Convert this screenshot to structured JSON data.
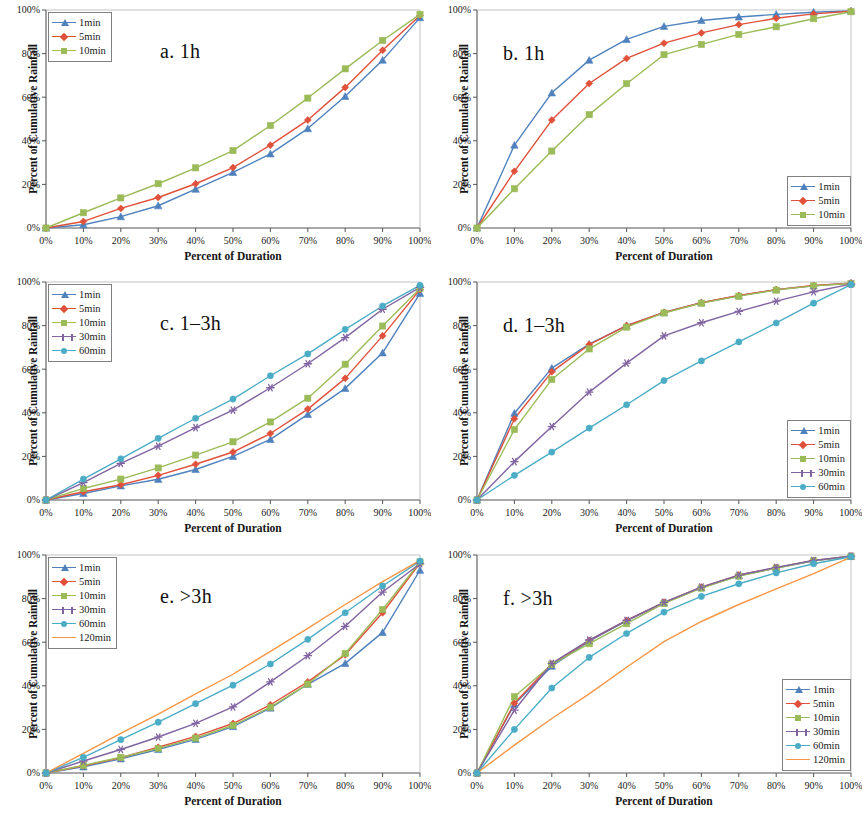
{
  "figure": {
    "axis_x_label": "Percent of Duration",
    "axis_y_label": "Percent of Cumulative Rainfall",
    "x_ticks": [
      "0%",
      "10%",
      "20%",
      "30%",
      "40%",
      "50%",
      "60%",
      "70%",
      "80%",
      "90%",
      "100%"
    ],
    "y_ticks": [
      "0%",
      "20%",
      "40%",
      "60%",
      "80%",
      "100%"
    ]
  },
  "colors": {
    "1min": "#4f81bd",
    "5min": "#e0503a",
    "10min": "#9bbb59",
    "30min": "#8064a2",
    "60min": "#4bacc6",
    "120min": "#f79646"
  },
  "chart_data": [
    {
      "type": "line",
      "panel": "a",
      "title": "a. 1h",
      "title_pos": "center",
      "legend_position": "top-left",
      "xlabel": "Percent of Duration",
      "ylabel": "Percent of Cumulative Rainfall",
      "xlim": [
        0,
        100
      ],
      "ylim": [
        0,
        100
      ],
      "grid": false,
      "x": [
        0,
        10,
        20,
        30,
        40,
        50,
        60,
        70,
        80,
        90,
        100
      ],
      "series": [
        {
          "name": "1min",
          "marker": "triangle",
          "values": [
            0,
            1.5,
            5.2,
            10.2,
            17.8,
            25.5,
            34.0,
            45.6,
            60.4,
            77.0,
            96.5
          ]
        },
        {
          "name": "5min",
          "marker": "diamond",
          "values": [
            0,
            3.0,
            9.0,
            14.0,
            20.3,
            27.7,
            38.0,
            49.5,
            64.5,
            81.5,
            97.5
          ]
        },
        {
          "name": "10min",
          "marker": "square",
          "values": [
            0,
            7.0,
            13.8,
            20.3,
            27.6,
            35.5,
            47.0,
            59.6,
            73.0,
            86.0,
            98.0
          ]
        }
      ]
    },
    {
      "type": "line",
      "panel": "b",
      "title": "b. 1h",
      "title_pos": "left",
      "legend_position": "bottom-right",
      "xlabel": "Percent of Duration",
      "ylabel": "Percent of Cumulative Rainfall",
      "xlim": [
        0,
        100
      ],
      "ylim": [
        0,
        100
      ],
      "grid": false,
      "x": [
        0,
        10,
        20,
        30,
        40,
        50,
        60,
        70,
        80,
        90,
        100
      ],
      "series": [
        {
          "name": "1min",
          "marker": "triangle",
          "values": [
            0,
            38.0,
            62.0,
            77.0,
            86.5,
            92.5,
            95.2,
            96.8,
            98.0,
            99.0,
            99.6
          ]
        },
        {
          "name": "5min",
          "marker": "diamond",
          "values": [
            0,
            26.0,
            49.5,
            66.3,
            77.8,
            84.8,
            89.5,
            93.3,
            96.2,
            98.2,
            99.4
          ]
        },
        {
          "name": "10min",
          "marker": "square",
          "values": [
            0,
            18.0,
            35.3,
            52.0,
            66.2,
            79.5,
            84.2,
            88.8,
            92.3,
            96.0,
            99.2
          ]
        }
      ]
    },
    {
      "type": "line",
      "panel": "c",
      "title": "c. 1–3h",
      "title_pos": "center",
      "legend_position": "top-left",
      "xlabel": "Percent of Duration",
      "ylabel": "Percent of Cumulative Rainfall",
      "xlim": [
        0,
        100
      ],
      "ylim": [
        0,
        100
      ],
      "grid": false,
      "x": [
        0,
        10,
        20,
        30,
        40,
        50,
        60,
        70,
        80,
        90,
        100
      ],
      "series": [
        {
          "name": "1min",
          "marker": "triangle",
          "values": [
            0,
            3.0,
            6.5,
            9.5,
            14.0,
            20.0,
            27.8,
            39.3,
            51.2,
            67.5,
            94.8
          ]
        },
        {
          "name": "5min",
          "marker": "diamond",
          "values": [
            0,
            3.8,
            7.0,
            11.3,
            16.4,
            22.0,
            30.5,
            41.7,
            55.8,
            75.3,
            96.5
          ]
        },
        {
          "name": "10min",
          "marker": "square",
          "values": [
            0,
            5.3,
            9.6,
            14.7,
            20.6,
            26.7,
            35.8,
            46.7,
            62.3,
            79.8,
            97.0
          ]
        },
        {
          "name": "30min",
          "marker": "star",
          "values": [
            0,
            8.0,
            16.8,
            24.7,
            33.2,
            41.2,
            51.5,
            62.5,
            74.5,
            87.5,
            97.5
          ]
        },
        {
          "name": "60min",
          "marker": "circle",
          "values": [
            0,
            9.6,
            18.9,
            28.3,
            37.5,
            46.3,
            57.0,
            67.0,
            78.3,
            89.0,
            98.5
          ]
        }
      ]
    },
    {
      "type": "line",
      "panel": "d",
      "title": "d. 1–3h",
      "title_pos": "left",
      "legend_position": "bottom-right",
      "xlabel": "Percent of Duration",
      "ylabel": "Percent of Cumulative Rainfall",
      "xlim": [
        0,
        100
      ],
      "ylim": [
        0,
        100
      ],
      "grid": false,
      "x": [
        0,
        10,
        20,
        30,
        40,
        50,
        60,
        70,
        80,
        90,
        100
      ],
      "series": [
        {
          "name": "1min",
          "marker": "triangle",
          "values": [
            0,
            39.8,
            60.5,
            71.5,
            80.0,
            86.0,
            90.5,
            93.7,
            96.5,
            98.3,
            99.5
          ]
        },
        {
          "name": "5min",
          "marker": "diamond",
          "values": [
            0,
            37.3,
            58.8,
            71.3,
            80.0,
            86.0,
            90.5,
            93.8,
            96.5,
            98.4,
            99.5
          ]
        },
        {
          "name": "10min",
          "marker": "square",
          "values": [
            0,
            32.3,
            55.3,
            69.3,
            79.3,
            85.8,
            90.3,
            93.5,
            96.3,
            98.2,
            99.3
          ]
        },
        {
          "name": "30min",
          "marker": "star",
          "values": [
            0,
            17.6,
            33.7,
            49.5,
            62.8,
            75.3,
            81.3,
            86.5,
            91.2,
            95.5,
            99.0
          ]
        },
        {
          "name": "60min",
          "marker": "circle",
          "values": [
            0,
            11.3,
            22.0,
            33.0,
            43.7,
            54.8,
            63.8,
            72.5,
            81.2,
            90.3,
            98.8
          ]
        }
      ]
    },
    {
      "type": "line",
      "panel": "e",
      "title": "e. >3h",
      "title_pos": "center",
      "legend_position": "top-left",
      "xlabel": "Percent of Duration",
      "ylabel": "Percent of Cumulative Rainfall",
      "xlim": [
        0,
        100
      ],
      "ylim": [
        0,
        100
      ],
      "grid": false,
      "x": [
        0,
        10,
        20,
        30,
        40,
        50,
        60,
        70,
        80,
        90,
        100
      ],
      "series": [
        {
          "name": "1min",
          "marker": "triangle",
          "values": [
            0,
            2.8,
            6.5,
            10.8,
            15.4,
            21.3,
            29.8,
            40.7,
            50.3,
            64.5,
            93.0
          ]
        },
        {
          "name": "5min",
          "marker": "diamond",
          "values": [
            0,
            3.3,
            7.0,
            11.8,
            16.8,
            22.7,
            31.3,
            41.8,
            54.2,
            73.5,
            96.3
          ]
        },
        {
          "name": "10min",
          "marker": "square",
          "values": [
            0,
            3.5,
            7.2,
            11.3,
            16.0,
            21.8,
            30.2,
            40.8,
            54.8,
            75.0,
            96.8
          ]
        },
        {
          "name": "30min",
          "marker": "star",
          "values": [
            0,
            5.5,
            10.8,
            16.5,
            22.8,
            30.3,
            41.8,
            53.8,
            67.3,
            83.0,
            96.0
          ]
        },
        {
          "name": "60min",
          "marker": "circle",
          "values": [
            0,
            7.2,
            15.3,
            23.3,
            31.8,
            40.3,
            50.0,
            61.3,
            73.5,
            85.8,
            97.2
          ]
        },
        {
          "name": "120min",
          "marker": "none",
          "values": [
            0,
            9.0,
            18.2,
            27.0,
            36.3,
            45.3,
            55.8,
            66.3,
            77.3,
            87.8,
            97.5
          ]
        }
      ]
    },
    {
      "type": "line",
      "panel": "f",
      "title": "f. >3h",
      "title_pos": "left",
      "legend_position": "bottom-right",
      "xlabel": "Percent of Duration",
      "ylabel": "Percent of Cumulative Rainfall",
      "xlim": [
        0,
        100
      ],
      "ylim": [
        0,
        100
      ],
      "grid": false,
      "x": [
        0,
        10,
        20,
        30,
        40,
        50,
        60,
        70,
        80,
        90,
        100
      ],
      "series": [
        {
          "name": "1min",
          "marker": "triangle",
          "values": [
            0,
            31.5,
            49.0,
            60.5,
            69.8,
            78.0,
            85.0,
            90.5,
            94.0,
            97.3,
            99.4
          ]
        },
        {
          "name": "5min",
          "marker": "diamond",
          "values": [
            0,
            32.0,
            50.0,
            60.8,
            70.0,
            78.3,
            85.3,
            90.8,
            94.2,
            97.5,
            99.5
          ]
        },
        {
          "name": "10min",
          "marker": "square",
          "values": [
            0,
            35.0,
            49.8,
            59.3,
            68.5,
            77.8,
            84.8,
            90.3,
            94.0,
            97.3,
            99.4
          ]
        },
        {
          "name": "30min",
          "marker": "star",
          "values": [
            0,
            28.8,
            50.3,
            61.0,
            70.0,
            78.3,
            85.3,
            90.8,
            94.3,
            97.5,
            99.5
          ]
        },
        {
          "name": "60min",
          "marker": "circle",
          "values": [
            0,
            20.0,
            39.0,
            53.0,
            64.0,
            73.8,
            81.0,
            86.8,
            91.8,
            96.0,
            99.2
          ]
        },
        {
          "name": "120min",
          "marker": "none",
          "values": [
            0,
            12.8,
            25.0,
            36.3,
            48.5,
            60.3,
            69.5,
            77.3,
            84.5,
            91.5,
            99.0
          ]
        }
      ]
    }
  ],
  "legends": {
    "a": [
      "1min",
      "5min",
      "10min"
    ],
    "b": [
      "1min",
      "5min",
      "10min"
    ],
    "c": [
      "1min",
      "5min",
      "10min",
      "30min",
      "60min"
    ],
    "d": [
      "1min",
      "5min",
      "10min",
      "30min",
      "60min"
    ],
    "e": [
      "1min",
      "5min",
      "10min",
      "30min",
      "60min",
      "120min"
    ],
    "f": [
      "1min",
      "5min",
      "10min",
      "30min",
      "60min",
      "120min"
    ]
  }
}
